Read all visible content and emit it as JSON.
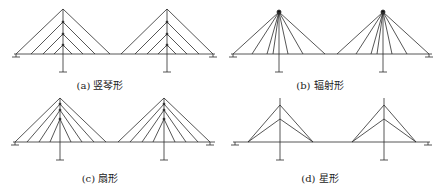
{
  "figure": {
    "panels": [
      {
        "id": "a",
        "caption": "(a) 竖琴形",
        "type": "harp"
      },
      {
        "id": "b",
        "caption": "(b) 辐射形",
        "type": "radial"
      },
      {
        "id": "c",
        "caption": "(c) 扇形",
        "type": "fan"
      },
      {
        "id": "d",
        "caption": "(d) 星形",
        "type": "star"
      }
    ],
    "colors": {
      "line": "#2b2b2b",
      "background": "#ffffff"
    }
  }
}
